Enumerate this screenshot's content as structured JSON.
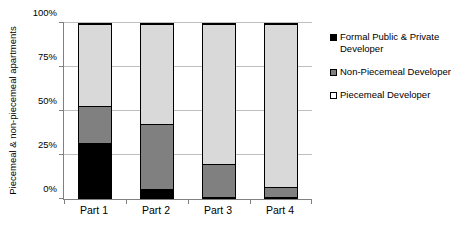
{
  "chart_data": {
    "type": "bar",
    "stacked": true,
    "title": "",
    "xlabel": "",
    "ylabel": "Piecemeal & non-piecemeal apartments",
    "categories": [
      "Part 1",
      "Part 2",
      "Part 3",
      "Part 4"
    ],
    "ylim": [
      0,
      100
    ],
    "ytick_labels": [
      "0%",
      "25%",
      "50%",
      "75%",
      "100%"
    ],
    "ytick_values": [
      0,
      25,
      50,
      75,
      100
    ],
    "grid": true,
    "legend_position": "right",
    "series": [
      {
        "name": "Formal Public & Private Developer",
        "color": "#000000",
        "values": [
          32,
          6,
          1,
          1
        ]
      },
      {
        "name": "Non-Piecemeal Developer",
        "color": "#808080",
        "values": [
          21,
          37,
          19,
          6
        ]
      },
      {
        "name": "Piecemeal Developer",
        "color": "#d9d9d9",
        "values": [
          47,
          57,
          80,
          93
        ]
      }
    ]
  }
}
